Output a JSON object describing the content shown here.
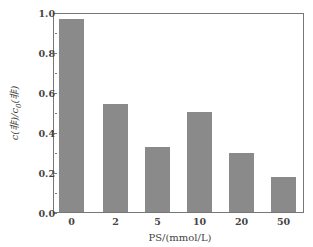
{
  "chart_data": {
    "type": "bar",
    "title": "",
    "xlabel": "PS/(mmol/L)",
    "ylabel": "c(非)/c0(非)",
    "categories": [
      "0",
      "2",
      "5",
      "10",
      "20",
      "50"
    ],
    "values": [
      0.97,
      0.545,
      0.325,
      0.505,
      0.295,
      0.175
    ],
    "ylim": [
      0.0,
      1.0
    ],
    "yticks": [
      "0.0",
      "0.2",
      "0.4",
      "0.6",
      "0.8",
      "1.0"
    ],
    "grid": false,
    "legend": null,
    "bar_color": "#8a8a8a"
  },
  "axes": {
    "xlabel": "PS/(mmol/L)",
    "ylabel_main": "c(非)/c",
    "ylabel_sub": "0",
    "ylabel_tail": "(非)"
  }
}
